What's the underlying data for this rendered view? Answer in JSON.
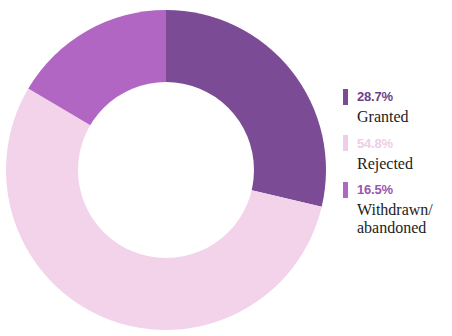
{
  "chart_data": {
    "type": "pie",
    "variant": "donut",
    "title": "",
    "subtitle": "",
    "xlabel": "",
    "ylabel": "",
    "grid": false,
    "legend_position": "right",
    "hole_ratio": 0.55,
    "start_angle_deg": 0,
    "direction": "clockwise",
    "units": "percent",
    "total": 100.0,
    "categories": [
      "Granted",
      "Rejected",
      "Withdrawn/abandoned"
    ],
    "values": [
      28.7,
      54.8,
      16.5
    ],
    "value_labels": [
      "28.7%",
      "54.8%",
      "16.5%"
    ],
    "colors": [
      "#7C4B96",
      "#F2D3EA",
      "#B266C4"
    ],
    "slices": [
      {
        "label": "Granted",
        "label_display": "Granted",
        "value": 28.7,
        "value_label": "28.7%",
        "color": "#7C4B96",
        "start_angle_deg": 0,
        "end_angle_deg": 103.32
      },
      {
        "label": "Rejected",
        "label_display": "Rejected",
        "value": 54.8,
        "value_label": "54.8%",
        "color": "#F2D3EA",
        "start_angle_deg": 103.32,
        "end_angle_deg": 300.6
      },
      {
        "label": "Withdrawn/abandoned",
        "label_display": "Withdrawn/\nabandoned",
        "value": 16.5,
        "value_label": "16.5%",
        "color": "#B266C4",
        "start_angle_deg": 300.6,
        "end_angle_deg": 360
      }
    ]
  },
  "legend": {
    "items": [
      {
        "value_label": "28.7%",
        "label": "Granted",
        "swatch_color": "#7C4B96",
        "value_color": "#6E4088"
      },
      {
        "value_label": "54.8%",
        "label": "Rejected",
        "swatch_color": "#EFCDE8",
        "value_color": "#EFCDE8"
      },
      {
        "value_label": "16.5%",
        "label": "Withdrawn/\nabandoned",
        "swatch_color": "#B266C4",
        "value_color": "#9B56B0"
      }
    ]
  },
  "canvas": {
    "background": "#FFFFFF",
    "hole_color": "#FFFFFF"
  }
}
